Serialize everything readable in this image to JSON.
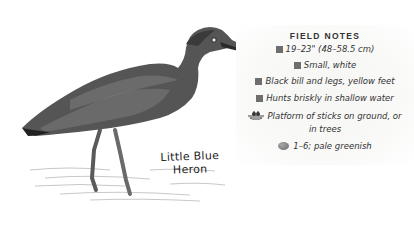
{
  "species": {
    "name_line1": "Little Blue",
    "name_line2": "Heron"
  },
  "field_notes": {
    "title": "FIELD NOTES",
    "items": [
      {
        "icon": "gray-square-icon",
        "text": "19–23\" (48–58.5 cm)"
      },
      {
        "icon": "gray-square-icon",
        "text": "Small, white"
      },
      {
        "icon": "gray-square-icon",
        "text": "Black bill and legs, yellow feet"
      },
      {
        "icon": "gray-square-icon",
        "text": "Hunts briskly in shallow water"
      },
      {
        "icon": "nest-icon",
        "text": "Platform of sticks on ground, or",
        "text_line2": "in trees"
      },
      {
        "icon": "egg-icon",
        "text": "1–6; pale greenish"
      }
    ]
  },
  "colors": {
    "bullet": "#6e6e6e",
    "text": "#333333",
    "bird_dark": "#3a3a3a",
    "bird_mid": "#6b6b6b"
  }
}
